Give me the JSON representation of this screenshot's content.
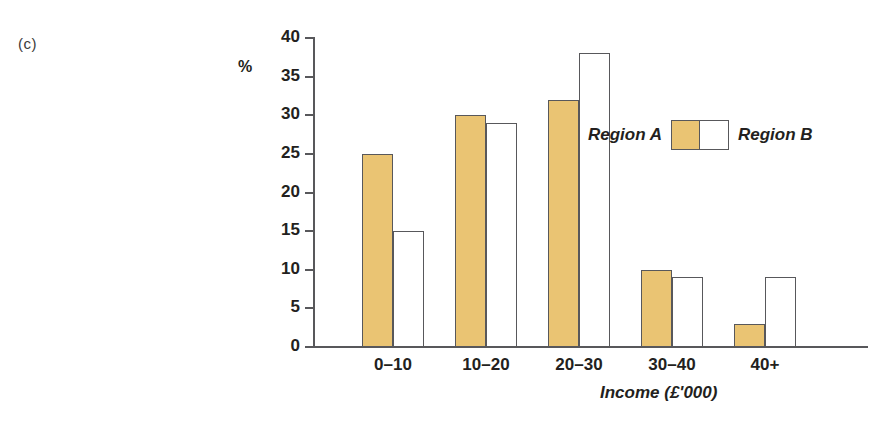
{
  "panel": {
    "label": "(c)"
  },
  "chart_data": {
    "type": "bar",
    "title": "",
    "subtitle": "",
    "xlabel": "Income (£'000)",
    "ylabel": "%",
    "categories": [
      "0–10",
      "10–20",
      "20–30",
      "30–40",
      "40+"
    ],
    "series": [
      {
        "name": "Region A",
        "values": [
          25,
          30,
          32,
          10,
          3
        ],
        "color": "#eac473"
      },
      {
        "name": "Region B",
        "values": [
          15,
          29,
          38,
          9,
          9
        ],
        "color": "#ffffff"
      }
    ],
    "ylim": [
      0,
      40
    ],
    "yticks": [
      0,
      5,
      10,
      15,
      20,
      25,
      30,
      35,
      40
    ],
    "ytick_labels": [
      "0",
      "5",
      "10",
      "15",
      "20",
      "25",
      "30",
      "35",
      "40"
    ],
    "grid": false,
    "legend_position": "inside-right",
    "axis_color": "#58585b",
    "bar_border_color": "#58585b"
  },
  "legend": {
    "left_label": "Region A",
    "right_label": "Region B"
  }
}
